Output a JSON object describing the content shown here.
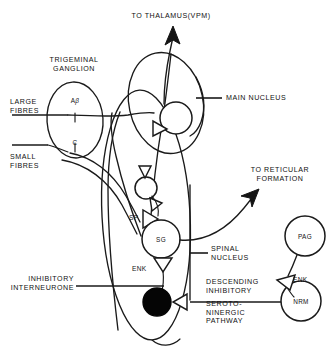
{
  "figure": {
    "title_top": "TO THALAMUS(VPM)",
    "background_color": "#ffffff",
    "ink_color": "#111111"
  },
  "labels": {
    "to_thalamus": "TO THALAMUS(VPM)",
    "trigeminal_ganglion": "TRIGEMINAL\nGANGLION",
    "large_fibres": "LARGE\nFIBRES",
    "small_fibres": "SMALL\nFIBRES",
    "main_nucleus": "MAIN NUCLEUS",
    "to_reticular_formation": "TO RETICULAR\nFORMATION",
    "spinal_nucleus": "SPINAL\nNUCLEUS",
    "inhibitory_interneurone": "INHIBITORY\nINTERNEURONE",
    "descending_inhibitory": "DESCENDING\nINHIBITORY",
    "serotoninergic_pathway": "SEROTO-\nNINERGIC\nPATHWAY"
  },
  "cells": {
    "a_beta": {
      "label_main": "A",
      "label_greek": "β"
    },
    "c_fibre": {
      "label": "C"
    },
    "sg": {
      "label": "SG"
    },
    "pag": {
      "label": "PAG"
    },
    "nrm": {
      "label": "NRM"
    }
  },
  "transmitters": {
    "substance_p": "SP",
    "enkephalin_spinal": "ENK",
    "enkephalin_pag": "ENK"
  },
  "icons": {
    "thalamus_arrow": "arrow-up-icon",
    "reticular_arrow": "arrow-curved-up-right-icon",
    "synapse": "synapse-triangle-icon",
    "open_neuron": "neuron-circle-icon",
    "filled_neuron": "inhibitory-neuron-filled-icon"
  }
}
